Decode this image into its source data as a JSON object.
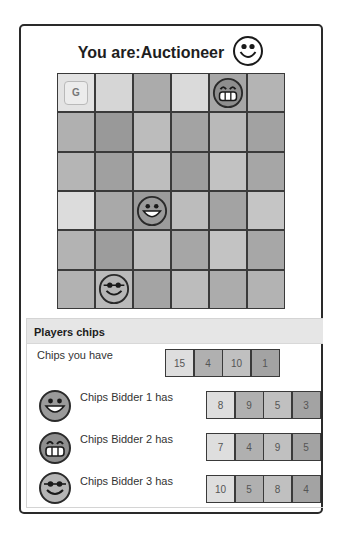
{
  "header": {
    "title": "You are:Auctioneer",
    "role_icon": "smiley-face-icon"
  },
  "board": {
    "rows": 6,
    "cols": 6,
    "cells": [
      [
        "#e3e3e3",
        "#d6d6d6",
        "#ababab",
        "#dadada",
        "#a6a6a6",
        "#b4b4b4"
      ],
      [
        "#b0b0b0",
        "#999999",
        "#bcbcbc",
        "#a3a3a3",
        "#b9b9b9",
        "#a2a2a2"
      ],
      [
        "#b5b5b5",
        "#a0a0a0",
        "#bebebe",
        "#9d9d9d",
        "#c2c2c2",
        "#a6a6a6"
      ],
      [
        "#dcdcdc",
        "#a9a9a9",
        "#9b9b9b",
        "#bcbcbc",
        "#a3a3a3",
        "#c5c5c5"
      ],
      [
        "#b3b3b3",
        "#9d9d9d",
        "#bdbdbd",
        "#a6a6a6",
        "#c3c3c3",
        "#a7a7a7"
      ],
      [
        "#b2b2b2",
        "#bababa",
        "#a4a4a4",
        "#bcbcbc",
        "#acacac",
        "#b3b3b3"
      ]
    ],
    "goal": {
      "row": 0,
      "col": 0,
      "label": "G"
    },
    "pieces": [
      {
        "row": 0,
        "col": 4,
        "icon": "grinning-face-icon",
        "player": "Bidder 2"
      },
      {
        "row": 3,
        "col": 2,
        "icon": "big-smile-face-icon",
        "player": "Bidder 1"
      },
      {
        "row": 5,
        "col": 1,
        "icon": "cool-smile-face-icon",
        "player": "Bidder 3"
      }
    ]
  },
  "chips_panel": {
    "title": "Players chips",
    "you": {
      "label": "Chips you have",
      "chips": [
        {
          "value": "15",
          "color": "#dedede"
        },
        {
          "value": "4",
          "color": "#b0b0b0"
        },
        {
          "value": "10",
          "color": "#c0c0c0"
        },
        {
          "value": "1",
          "color": "#a3a3a3"
        }
      ]
    },
    "bidders": [
      {
        "label": "Chips Bidder 1 has",
        "icon": "big-smile-face-icon",
        "chips": [
          {
            "value": "8",
            "color": "#dedede"
          },
          {
            "value": "9",
            "color": "#b0b0b0"
          },
          {
            "value": "5",
            "color": "#c0c0c0"
          },
          {
            "value": "3",
            "color": "#a3a3a3"
          }
        ]
      },
      {
        "label": "Chips Bidder 2 has",
        "icon": "grinning-face-icon",
        "chips": [
          {
            "value": "7",
            "color": "#dedede"
          },
          {
            "value": "4",
            "color": "#b0b0b0"
          },
          {
            "value": "9",
            "color": "#c0c0c0"
          },
          {
            "value": "5",
            "color": "#a3a3a3"
          }
        ]
      },
      {
        "label": "Chips Bidder 3 has",
        "icon": "cool-smile-face-icon",
        "chips": [
          {
            "value": "10",
            "color": "#dedede"
          },
          {
            "value": "5",
            "color": "#b0b0b0"
          },
          {
            "value": "8",
            "color": "#c0c0c0"
          },
          {
            "value": "4",
            "color": "#a3a3a3"
          }
        ]
      }
    ]
  }
}
